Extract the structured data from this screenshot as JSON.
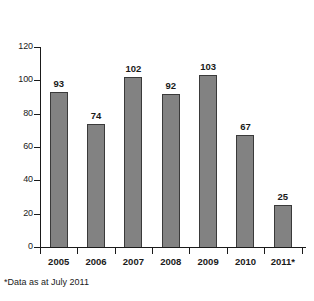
{
  "chart_data": {
    "type": "bar",
    "title": "",
    "subtitle": "",
    "xlabel": "",
    "ylabel": "",
    "categories": [
      "2005",
      "2006",
      "2007",
      "2008",
      "2009",
      "2010",
      "2011*"
    ],
    "values": [
      93,
      74,
      102,
      92,
      103,
      67,
      25
    ],
    "data_labels": [
      "93",
      "74",
      "102",
      "92",
      "103",
      "67",
      "25"
    ],
    "ylim": [
      0,
      120
    ],
    "ytick_labels": [
      "0",
      "20",
      "40",
      "60",
      "80",
      "100",
      "120"
    ],
    "ytick_values": [
      0,
      20,
      40,
      60,
      80,
      100,
      120
    ],
    "grid": false,
    "legend": null,
    "annotations": [
      "*Data as at July 2011"
    ],
    "bar_color": "#828282",
    "bar_edge_color": "#3a3a3a",
    "axis_color": "#1a1a1a",
    "background_color": "#ffffff"
  },
  "footnote": {
    "text": "*Data as at July 2011"
  }
}
